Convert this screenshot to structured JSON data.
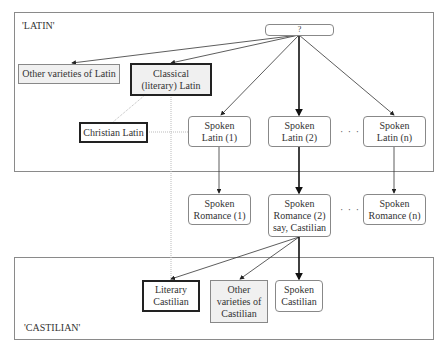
{
  "regions": {
    "latin": {
      "label": "'LATIN'"
    },
    "castilian": {
      "label": "'CASTILIAN'"
    }
  },
  "nodes": {
    "root": {
      "label": "?"
    },
    "other_latin": {
      "label": "Other varieties of Latin"
    },
    "classical_latin": {
      "label": "Classical (literary) Latin"
    },
    "christian_latin": {
      "label": "Christian Latin"
    },
    "spoken_latin_1": {
      "label": "Spoken Latin (1)"
    },
    "spoken_latin_2": {
      "label": "Spoken Latin (2)"
    },
    "spoken_latin_n": {
      "label": "Spoken Latin (n)"
    },
    "spoken_romance_1": {
      "label": "Spoken Romance (1)"
    },
    "spoken_romance_2": {
      "label": "Spoken Romance (2) say, Castilian"
    },
    "spoken_romance_n": {
      "label": "Spoken Romance (n)"
    },
    "literary_castilian": {
      "label": "Literary Castilian"
    },
    "other_castilian": {
      "label": "Other varieties of Castilian"
    },
    "spoken_castilian": {
      "label": "Spoken Castilian"
    }
  },
  "ellipsis": {
    "latin_row": "· · ·",
    "romance_row": "· · ·"
  },
  "colors": {
    "gray_fill": "#f0f0f0",
    "thick_border": "#222222",
    "thin_border": "#888888",
    "dotted": "#bbbbbb"
  }
}
